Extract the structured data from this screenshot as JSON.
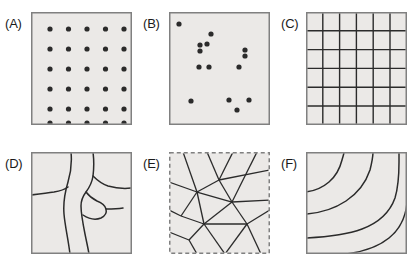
{
  "figure": {
    "type": "multi-panel-spatial-pattern-diagram",
    "panel_count": 6,
    "background_color": "#ffffff",
    "panel_fill_color": "#ebe9e7",
    "panel_border_color": "#808080",
    "feature_color": "#2b2b2b",
    "label_color": "#1a1a1a"
  },
  "panels": [
    {
      "id": "A",
      "label": "(A)",
      "pattern_name": "regular-point-lattice",
      "border_style": "solid",
      "box": {
        "x": 31,
        "y": 12,
        "w": 101,
        "h": 113
      },
      "label_pos": {
        "x": 5,
        "y": 17
      },
      "dots": {
        "columns": 5,
        "rows": 6,
        "count": 30,
        "radius": 2.6,
        "x_positions": [
          14,
          32.5,
          51,
          69.5,
          88
        ],
        "y_positions": [
          11,
          31,
          51,
          71,
          91,
          105
        ]
      }
    },
    {
      "id": "B",
      "label": "(B)",
      "pattern_name": "random-clustered-point-pattern",
      "border_style": "solid",
      "box": {
        "x": 169,
        "y": 12,
        "w": 101,
        "h": 113
      },
      "label_pos": {
        "x": 143,
        "y": 17
      },
      "dots": {
        "count": 14,
        "radius": 2.6,
        "points": [
          [
            5,
            6
          ],
          [
            37,
            16
          ],
          [
            26,
            27
          ],
          [
            26,
            33
          ],
          [
            33,
            26
          ],
          [
            71,
            32
          ],
          [
            71,
            38
          ],
          [
            25,
            49
          ],
          [
            35,
            49
          ],
          [
            65,
            49
          ],
          [
            17,
            83
          ],
          [
            55,
            82
          ],
          [
            75,
            82
          ],
          [
            63,
            92
          ]
        ]
      }
    },
    {
      "id": "C",
      "label": "(C)",
      "pattern_name": "regular-grid-tessellation",
      "border_style": "solid",
      "box": {
        "x": 306,
        "y": 12,
        "w": 101,
        "h": 113
      },
      "label_pos": {
        "x": 281,
        "y": 17
      },
      "grid": {
        "columns": 6,
        "rows": 6,
        "cell_count": 36,
        "x_lines": [
          0,
          16.8,
          33.6,
          50.4,
          67.2,
          84,
          101
        ],
        "y_lines": [
          0,
          18.8,
          37.6,
          56.4,
          75.2,
          94,
          113
        ]
      }
    },
    {
      "id": "D",
      "label": "(D)",
      "pattern_name": "irregular-polygonal-cells",
      "border_style": "solid",
      "box": {
        "x": 31,
        "y": 152,
        "w": 101,
        "h": 102
      },
      "label_pos": {
        "x": 5,
        "y": 157
      },
      "paths": [
        "M 40 0 C 41 10, 40 20, 37 30 C 34 40, 32 50, 33 62 C 34 74, 37 86, 39 102",
        "M 62 0 C 63 8, 63 16, 62 24 C 61 31, 58 36, 55 40 C 52 44, 50 48, 50 54 C 50 62, 52 72, 54 82 C 56 92, 57 96, 58 102",
        "M 0 43 C 8 42, 16 41, 23 40 C 29 39, 33 38, 37 35",
        "M 62 24 C 66 28, 71 32, 77 34 C 84 36, 92 37, 101 36",
        "M 55 40 C 58 44, 62 47, 66 49 C 71 51, 74 53, 75 57 C 76 61, 74 64, 70 66 C 65 68, 58 67, 52 63",
        "M 75 57 C 80 57, 86 57, 92 56"
      ]
    },
    {
      "id": "E",
      "label": "(E)",
      "pattern_name": "triangulated-irregular-network",
      "border_style": "dashed",
      "box": {
        "x": 169,
        "y": 152,
        "w": 101,
        "h": 102
      },
      "label_pos": {
        "x": 143,
        "y": 157
      },
      "vertices": [
        [
          28,
          40
        ],
        [
          50,
          28
        ],
        [
          12,
          64
        ],
        [
          63,
          50
        ],
        [
          35,
          72
        ],
        [
          78,
          72
        ],
        [
          20,
          88
        ],
        [
          56,
          102
        ]
      ],
      "edges": [
        [
          [
            28,
            40
          ],
          [
            50,
            28
          ]
        ],
        [
          [
            28,
            40
          ],
          [
            12,
            64
          ]
        ],
        [
          [
            28,
            40
          ],
          [
            63,
            50
          ]
        ],
        [
          [
            28,
            40
          ],
          [
            35,
            72
          ]
        ],
        [
          [
            50,
            28
          ],
          [
            63,
            50
          ]
        ],
        [
          [
            12,
            64
          ],
          [
            35,
            72
          ]
        ],
        [
          [
            63,
            50
          ],
          [
            35,
            72
          ]
        ],
        [
          [
            63,
            50
          ],
          [
            78,
            72
          ]
        ],
        [
          [
            35,
            72
          ],
          [
            78,
            72
          ]
        ],
        [
          [
            35,
            72
          ],
          [
            20,
            88
          ]
        ],
        [
          [
            35,
            72
          ],
          [
            56,
            102
          ]
        ],
        [
          [
            78,
            72
          ],
          [
            56,
            102
          ]
        ],
        [
          [
            28,
            40
          ],
          [
            14,
            0
          ]
        ],
        [
          [
            28,
            40
          ],
          [
            0,
            30
          ]
        ],
        [
          [
            50,
            28
          ],
          [
            38,
            0
          ]
        ],
        [
          [
            50,
            28
          ],
          [
            64,
            0
          ]
        ],
        [
          [
            63,
            50
          ],
          [
            101,
            48
          ]
        ],
        [
          [
            63,
            50
          ],
          [
            88,
            0
          ]
        ],
        [
          [
            78,
            72
          ],
          [
            101,
            58
          ]
        ],
        [
          [
            78,
            72
          ],
          [
            92,
            102
          ]
        ],
        [
          [
            12,
            64
          ],
          [
            0,
            58
          ]
        ],
        [
          [
            20,
            88
          ],
          [
            0,
            80
          ]
        ],
        [
          [
            20,
            88
          ],
          [
            28,
            102
          ]
        ],
        [
          [
            56,
            102
          ],
          [
            50,
            102
          ]
        ],
        [
          [
            50,
            28
          ],
          [
            101,
            18
          ]
        ]
      ]
    },
    {
      "id": "F",
      "label": "(F)",
      "pattern_name": "nested-contour-curves",
      "border_style": "solid",
      "box": {
        "x": 306,
        "y": 152,
        "w": 101,
        "h": 102
      },
      "label_pos": {
        "x": 281,
        "y": 157
      },
      "paths": [
        "M 0 40 C 8 39, 16 36, 23 30 C 30 24, 34 16, 36 8 C 37 4, 38 2, 38 0",
        "M 0 62 C 14 61, 28 57, 40 49 C 52 41, 60 30, 64 18 C 66 10, 67 4, 67 0",
        "M 0 86 C 20 85, 40 83, 56 77 C 72 71, 84 60, 89 46 C 92 36, 93 22, 93 10 C 93 5, 93 2, 93 0",
        "M 40 102 C 56 100, 72 95, 83 86 C 94 77, 100 64, 101 50"
      ]
    }
  ]
}
